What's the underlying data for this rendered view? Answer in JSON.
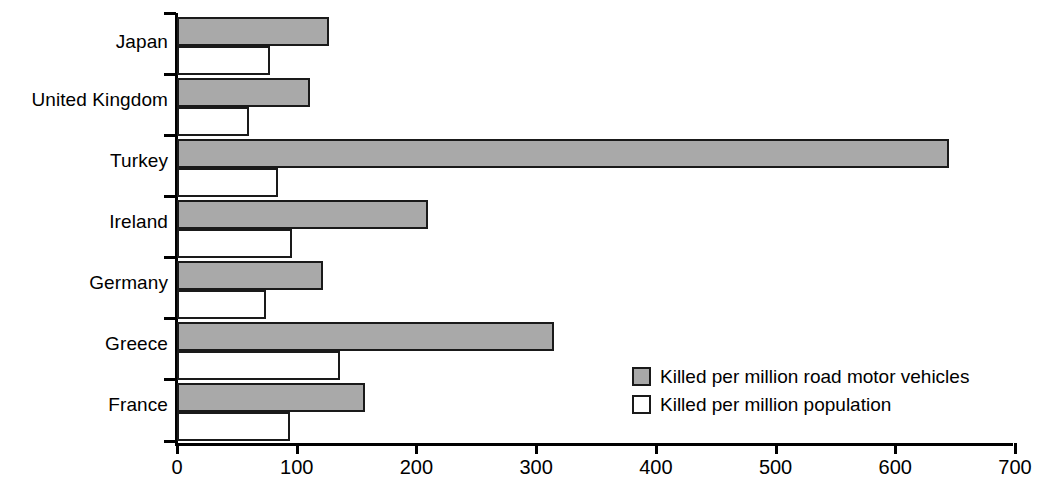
{
  "chart_data": {
    "type": "bar",
    "orientation": "horizontal",
    "title": "",
    "xlabel": "",
    "ylabel": "",
    "categories": [
      "Japan",
      "United Kingdom",
      "Turkey",
      "Ireland",
      "Germany",
      "Greece",
      "France"
    ],
    "series": [
      {
        "name": "Killed per million road motor vehicles",
        "color": "#a9a9a9",
        "values": [
          127,
          111,
          645,
          210,
          122,
          315,
          157
        ]
      },
      {
        "name": "Killed per million population",
        "color": "#ffffff",
        "values": [
          78,
          60,
          84,
          96,
          74,
          136,
          94
        ]
      }
    ],
    "xlim": [
      0,
      700
    ],
    "xticks": [
      0,
      100,
      200,
      300,
      400,
      500,
      600,
      700
    ],
    "xtick_labels": [
      "0",
      "100",
      "200",
      "300",
      "400",
      "500",
      "600",
      "700"
    ],
    "grid": false,
    "legend_position": "inside-lower-right"
  },
  "legend": {
    "entries": [
      {
        "label": "Killed per million road motor vehicles",
        "swatch": "gray"
      },
      {
        "label": "Killed per million population",
        "swatch": "white"
      }
    ]
  }
}
